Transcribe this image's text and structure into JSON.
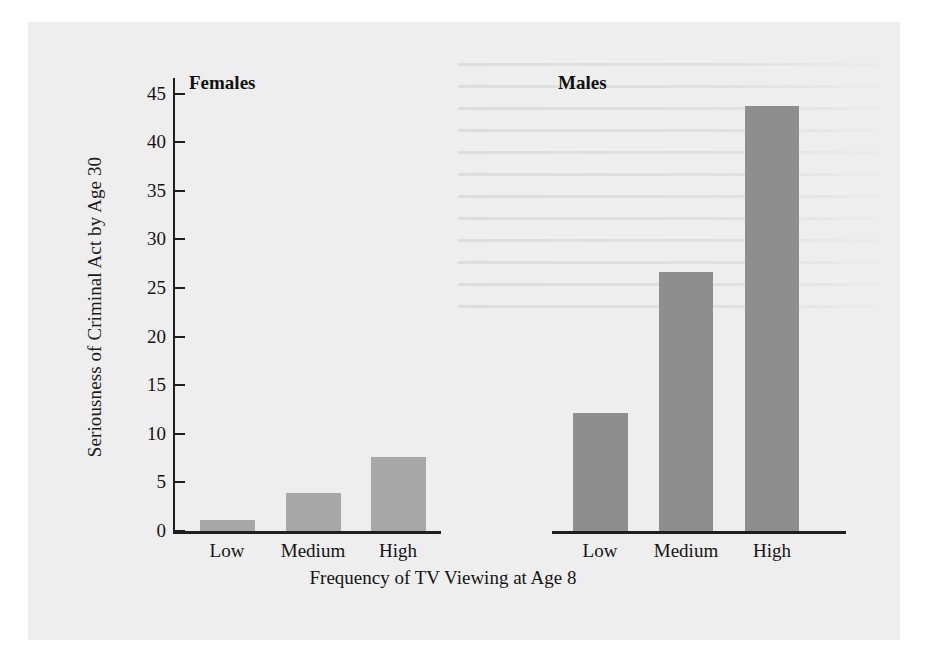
{
  "chart_data": {
    "type": "bar",
    "title": "",
    "xlabel": "Frequency of TV Viewing at Age 8",
    "ylabel": "Seriousness of Criminal Act by Age 30",
    "categories": [
      "Low",
      "Medium",
      "High"
    ],
    "ylim": [
      0,
      47
    ],
    "yticks": [
      0,
      5,
      10,
      15,
      20,
      25,
      30,
      35,
      40,
      45
    ],
    "ytick_labels": [
      "0",
      "5",
      "10",
      "15",
      "20",
      "25",
      "30",
      "35",
      "40",
      "45"
    ],
    "grid": false,
    "legend": "none",
    "panels": [
      {
        "name": "Females",
        "bar_color": "#a8a8a8",
        "categories": [
          "Low",
          "Medium",
          "High"
        ],
        "values": [
          1.1,
          3.9,
          7.6
        ]
      },
      {
        "name": "Males",
        "bar_color": "#8e8e8e",
        "categories": [
          "Low",
          "Medium",
          "High"
        ],
        "values": [
          12.1,
          26.6,
          43.7
        ]
      }
    ],
    "series": [
      {
        "name": "Females",
        "values": [
          1.1,
          3.9,
          7.6
        ]
      },
      {
        "name": "Males",
        "values": [
          12.1,
          26.6,
          43.7
        ]
      }
    ]
  },
  "figure": {
    "ylabel": "Seriousness of Criminal Act by Age 30",
    "xlabel": "Frequency of TV Viewing at Age 8",
    "panel_females_title": "Females",
    "panel_males_title": "Males",
    "ytick_labels": [
      "45",
      "40",
      "35",
      "30",
      "25",
      "20",
      "15",
      "10",
      "5",
      "0"
    ],
    "female_categories": [
      "Low",
      "Medium",
      "High"
    ],
    "male_categories": [
      "Low",
      "Medium",
      "High"
    ],
    "colors": {
      "page_background": "#eeeeee",
      "axis": "#1f1f1f",
      "bar_female": "#a8a8a8",
      "bar_male": "#8e8e8e",
      "text": "#141414"
    }
  }
}
